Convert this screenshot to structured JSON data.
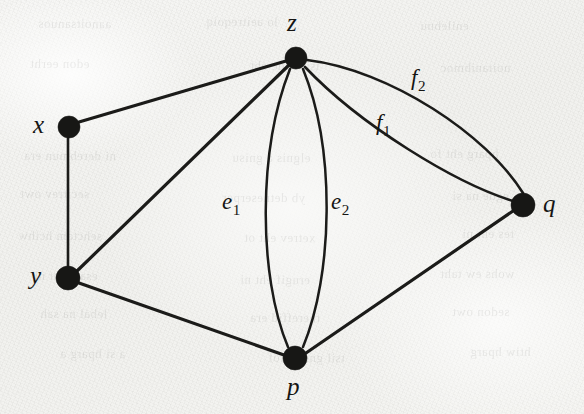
{
  "figure": {
    "kind": "undirected-multigraph-diagram",
    "background_color": "#f3f3f1",
    "ink_color": "#171715",
    "width": 584,
    "height": 414
  },
  "vertices": [
    {
      "id": "x",
      "label": "x",
      "cx": 69,
      "cy": 127,
      "r": 11,
      "label_x": 33,
      "label_y": 112,
      "label_anchor": "left"
    },
    {
      "id": "y",
      "label": "y",
      "cx": 68,
      "cy": 278,
      "r": 12,
      "label_x": 30,
      "label_y": 263,
      "label_anchor": "left"
    },
    {
      "id": "z",
      "label": "z",
      "cx": 296,
      "cy": 58,
      "r": 11,
      "label_x": 287,
      "label_y": 10,
      "label_anchor": "top"
    },
    {
      "id": "p",
      "label": "p",
      "cx": 295,
      "cy": 358,
      "r": 12,
      "label_x": 287,
      "label_y": 374,
      "label_anchor": "bottom"
    },
    {
      "id": "q",
      "label": "q",
      "cx": 523,
      "cy": 205,
      "r": 12,
      "label_x": 543,
      "label_y": 191,
      "label_anchor": "right"
    }
  ],
  "edges": [
    {
      "id": "xz",
      "from": "x",
      "to": "z",
      "label": "",
      "label_sub": "",
      "kind": "straight",
      "path": "M 79 122 L 286 61",
      "stroke_width": 3.2
    },
    {
      "id": "xy",
      "from": "x",
      "to": "y",
      "label": "",
      "label_sub": "",
      "kind": "straight",
      "path": "M 68 138 L 68 267",
      "stroke_width": 2.6
    },
    {
      "id": "yz",
      "from": "y",
      "to": "z",
      "label": "",
      "label_sub": "",
      "kind": "straight",
      "path": "M 77 271 L 288 66",
      "stroke_width": 3.2
    },
    {
      "id": "yp",
      "from": "y",
      "to": "p",
      "label": "",
      "label_sub": "",
      "kind": "straight",
      "path": "M 79 283 L 284 355",
      "stroke_width": 3.2
    },
    {
      "id": "pq",
      "from": "p",
      "to": "q",
      "label": "",
      "label_sub": "",
      "kind": "straight",
      "path": "M 306 353 L 513 211",
      "stroke_width": 3.2
    },
    {
      "id": "e1",
      "from": "z",
      "to": "p",
      "label": "e",
      "label_sub": "1",
      "kind": "curve-left",
      "path": "M 290 69 C 258 150, 258 275, 288 347",
      "stroke_width": 2.5,
      "label_x": 222,
      "label_y": 190
    },
    {
      "id": "e2",
      "from": "z",
      "to": "p",
      "label": "e",
      "label_sub": "2",
      "kind": "curve-right",
      "path": "M 303 69 C 336 150, 333 275, 303 347",
      "stroke_width": 2.5,
      "label_x": 331,
      "label_y": 190
    },
    {
      "id": "f1",
      "from": "z",
      "to": "q",
      "label": "f",
      "label_sub": "1",
      "kind": "curve-lower",
      "path": "M 305 67 C 360 125, 455 183, 513 201",
      "stroke_width": 2.6,
      "label_x": 376,
      "label_y": 111
    },
    {
      "id": "f2",
      "from": "z",
      "to": "q",
      "label": "f",
      "label_sub": "2",
      "kind": "curve-upper",
      "path": "M 307 60 C 390 70, 487 135, 523 193",
      "stroke_width": 2.6,
      "label_x": 411,
      "label_y": 66
    }
  ],
  "bleed_through": [
    {
      "text": "aanoitsanuos",
      "x": 38,
      "y": 16,
      "size": 13,
      "rot": -0.4
    },
    {
      "text": "lo aeitreqoiq",
      "x": 206,
      "y": 14,
      "size": 13,
      "rot": -0.3
    },
    {
      "text": "enilebnu",
      "x": 420,
      "y": 18,
      "size": 13,
      "rot": -0.2
    },
    {
      "text": "edon eerht",
      "x": 30,
      "y": 56,
      "size": 13,
      "rot": -0.3
    },
    {
      "text": "tsil egde eht",
      "x": 250,
      "y": 58,
      "size": 13,
      "rot": -0.3
    },
    {
      "text": "noitanibmoc",
      "x": 440,
      "y": 60,
      "size": 13,
      "rot": -0.2
    },
    {
      "text": "ni derebmun era",
      "x": 24,
      "y": 148,
      "size": 13,
      "rot": -0.3
    },
    {
      "text": "elgnis a gnisu",
      "x": 232,
      "y": 150,
      "size": 13,
      "rot": -0.3
    },
    {
      "text": "hparg eht fo",
      "x": 430,
      "y": 146,
      "size": 13,
      "rot": -0.2
    },
    {
      "text": "secitrev owt",
      "x": 20,
      "y": 186,
      "size": 13,
      "rot": -0.3
    },
    {
      "text": "yb detneserper",
      "x": 222,
      "y": 190,
      "size": 13,
      "rot": -0.3
    },
    {
      "text": "egde na si",
      "x": 452,
      "y": 188,
      "size": 13,
      "rot": -0.2
    },
    {
      "text": "sehctam hcihw",
      "x": 18,
      "y": 228,
      "size": 13,
      "rot": -0.3
    },
    {
      "text": "xetrev eht ot",
      "x": 244,
      "y": 230,
      "size": 13,
      "rot": -0.3
    },
    {
      "text": "tes eht ni",
      "x": 462,
      "y": 226,
      "size": 13,
      "rot": -0.2
    },
    {
      "text": "esac siht ni",
      "x": 34,
      "y": 268,
      "size": 13,
      "rot": -0.3
    },
    {
      "text": "erugif eht ni",
      "x": 240,
      "y": 272,
      "size": 13,
      "rot": -0.3
    },
    {
      "text": "wohs ew taht",
      "x": 440,
      "y": 266,
      "size": 13,
      "rot": -0.2
    },
    {
      "text": "lebal na sah",
      "x": 40,
      "y": 306,
      "size": 13,
      "rot": -0.3
    },
    {
      "text": "tnereffid era",
      "x": 250,
      "y": 310,
      "size": 13,
      "rot": -0.3
    },
    {
      "text": "sedon owt",
      "x": 452,
      "y": 304,
      "size": 13,
      "rot": -0.2
    },
    {
      "text": "a si hparg a",
      "x": 60,
      "y": 346,
      "size": 13,
      "rot": -0.3
    },
    {
      "text": "tsil gniwollof",
      "x": 268,
      "y": 350,
      "size": 13,
      "rot": -0.3
    },
    {
      "text": "htiw hparg",
      "x": 470,
      "y": 344,
      "size": 13,
      "rot": -0.2
    }
  ]
}
